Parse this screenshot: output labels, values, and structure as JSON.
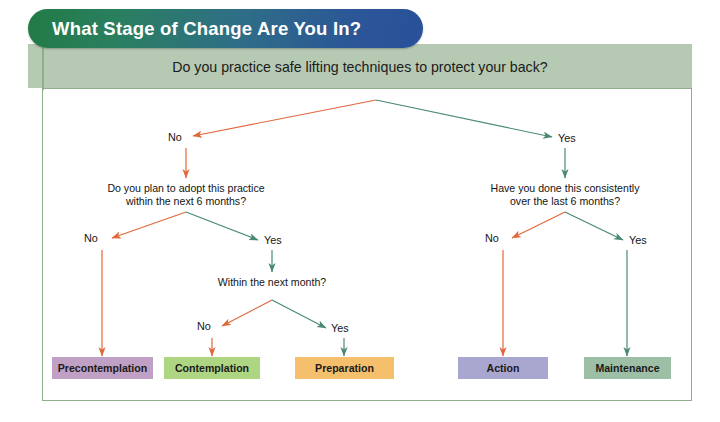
{
  "title": {
    "text": "What Stage of Change Are You In?",
    "gradient_start": "#227a46",
    "gradient_end": "#29509a"
  },
  "header": {
    "question": "Do you practice safe lifting techniques to protect your back?",
    "band_color": "#b6c9b2"
  },
  "flow": {
    "root_question": "Do you practice safe lifting techniques to protect your back?",
    "branch_no_1": "No",
    "branch_yes_1": "Yes",
    "left_question": "Do you plan to adopt this practice\nwithin the next 6 months?",
    "right_question": "Have you done this consistently\nover the last 6 months?",
    "left_no": "No",
    "left_yes": "Yes",
    "right_no": "No",
    "right_yes": "Yes",
    "month_question": "Within the next month?",
    "month_no": "No",
    "month_yes": "Yes"
  },
  "outcomes": [
    {
      "label": "Precontemplation",
      "color": "#c0a0c4"
    },
    {
      "label": "Contemplation",
      "color": "#aed582"
    },
    {
      "label": "Preparation",
      "color": "#f5bf6b"
    },
    {
      "label": "Action",
      "color": "#a9a7d0"
    },
    {
      "label": "Maintenance",
      "color": "#9dbfa5"
    }
  ],
  "colors": {
    "arrow_no": "#e0683a",
    "arrow_yes": "#4a8a72",
    "panel_border": "#8fae8c"
  }
}
